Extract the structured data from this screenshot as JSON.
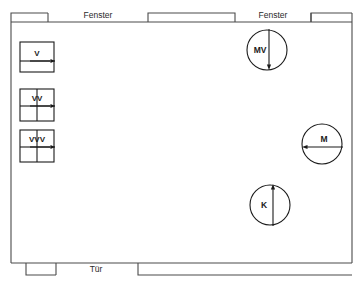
{
  "diagram": {
    "type": "floor-plan",
    "background_color": "#ffffff",
    "wall_color": "#4a4a4a",
    "symbol_color": "#1a1a1a"
  },
  "walls": {
    "top_label_left": "Fenster",
    "top_label_right": "Fenster",
    "bottom_label": "Tür",
    "openings": [
      {
        "name": "window-left",
        "label": "Fenster",
        "side": "top"
      },
      {
        "name": "window-right",
        "label": "Fenster",
        "side": "top"
      },
      {
        "name": "door",
        "label": "Tür",
        "side": "bottom"
      }
    ]
  },
  "equipment": {
    "boxes": [
      {
        "id": "v",
        "label": "V",
        "divisions": "horizontal"
      },
      {
        "id": "vv",
        "label": "VV",
        "divisions": "cross"
      },
      {
        "id": "vvv",
        "label": "VVV",
        "divisions": "cross"
      }
    ],
    "circles": [
      {
        "id": "mv",
        "label": "MV",
        "arrow": "down"
      },
      {
        "id": "m",
        "label": "M",
        "arrow": "left"
      },
      {
        "id": "k",
        "label": "K",
        "arrow": "up"
      }
    ]
  }
}
